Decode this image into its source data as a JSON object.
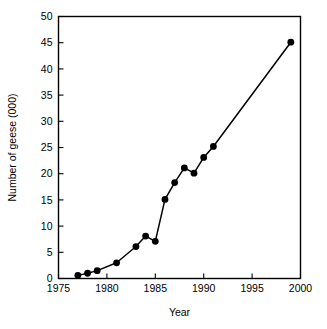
{
  "chart_data": {
    "type": "line",
    "title": "",
    "xlabel": "Year",
    "ylabel": "Number of geese (000)",
    "xlim": [
      1975,
      2000
    ],
    "ylim": [
      0,
      50
    ],
    "xticks": [
      1975,
      1980,
      1985,
      1990,
      1995,
      2000
    ],
    "yticks": [
      0,
      5,
      10,
      15,
      20,
      25,
      30,
      35,
      40,
      45,
      50
    ],
    "xtick_labels": [
      "1975",
      "1980",
      "1985",
      "1990",
      "1995",
      "2000"
    ],
    "ytick_labels": [
      "0",
      "5",
      "10",
      "15",
      "20",
      "25",
      "30",
      "35",
      "40",
      "45",
      "50"
    ],
    "grid": false,
    "legend": false,
    "legend_position": "none",
    "marker": "filled-circle",
    "line_color": "#000000",
    "marker_color": "#000000",
    "background_color": "#ffffff",
    "x": [
      1977,
      1978,
      1979,
      1981,
      1983,
      1984,
      1985,
      1986,
      1987,
      1988,
      1989,
      1990,
      1991,
      1999
    ],
    "values": [
      0.6,
      1.0,
      1.5,
      3.0,
      6.1,
      8.1,
      7.1,
      15.1,
      18.3,
      21.1,
      20.1,
      23.1,
      25.2,
      45.1
    ],
    "series": [
      {
        "name": "Number of geese (000)",
        "x": [
          1977,
          1978,
          1979,
          1981,
          1983,
          1984,
          1985,
          1986,
          1987,
          1988,
          1989,
          1990,
          1991,
          1999
        ],
        "values": [
          0.6,
          1.0,
          1.5,
          3.0,
          6.1,
          8.1,
          7.1,
          15.1,
          18.3,
          21.1,
          20.1,
          23.1,
          25.2,
          45.1
        ]
      }
    ],
    "annotations": []
  }
}
